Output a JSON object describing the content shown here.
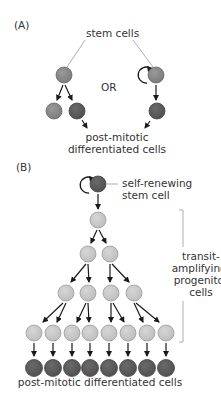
{
  "panel_a": {
    "label": "(A)",
    "stem_cells_label": "stem cells",
    "or_label": "OR",
    "post_mitotic_line1": "post-mitotic",
    "post_mitotic_line2": "differentiated cells"
  },
  "panel_b": {
    "label": "(B)",
    "stem_label_line1": "self-renewing",
    "stem_label_line2": "stem cell",
    "bracket_label_lines": [
      "transit-",
      "amplifying/",
      "progenitor",
      "cells"
    ],
    "bottom_label": "post-mitotic differentiated cells",
    "tree_rows": [
      1,
      2,
      4,
      8
    ],
    "differentiated_count": 8
  },
  "colors": {
    "stem_cell": "#8a8a8a",
    "stem_cell_border": "#6a6a6a",
    "differentiated_cell": "#5c5c5c",
    "differentiated_border": "#454545",
    "progenitor_cell": "#cacaca",
    "progenitor_border": "#9a9a9a",
    "line": "#999999",
    "arrow": "#1a1a1a"
  }
}
